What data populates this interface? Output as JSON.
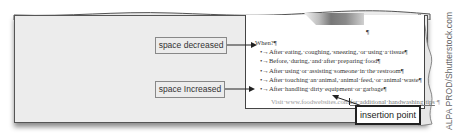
{
  "figure": {
    "callouts": {
      "space_decreased": "space decreased",
      "space_increased": "space Increased",
      "insertion_point": "insertion point"
    },
    "watermark": "ALPA PROD/Shutterstock.com"
  },
  "document": {
    "top_pilcrow": "¶",
    "heading": "When?¶",
    "bullets": [
      "•→After·eating,·coughing,·sneezing,·or·using·a·tissue¶",
      "•→Before,·during,·and·after·preparing·food¶",
      "•→After·using·or·assisting·someone·in·the·restroom¶",
      "•→After·touching·an·animal,·animal·feed,·or·animal·waste¶",
      "•→After·handling·dirty·equipment·or·garbage¶"
    ],
    "visit_line": {
      "prefix": "Visit·www.foodwebsites.com",
      "link_text": "for·additional·handwashing·tips",
      "suffix": "·¶"
    }
  },
  "colors": {
    "paper_bg": "#ececec",
    "page_bg": "#ffffff",
    "border": "#444444",
    "text": "#333333"
  }
}
